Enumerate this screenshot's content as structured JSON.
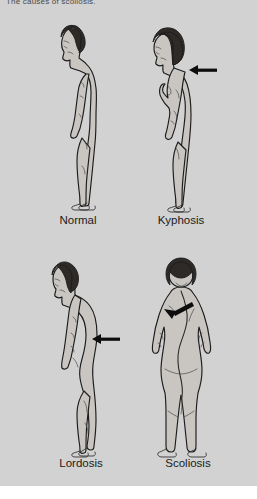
{
  "page": {
    "background_color": "#ffffff",
    "plate_color": "#d2d2d2",
    "partial_caption": "The causes of scoliosis."
  },
  "figures": [
    {
      "id": "normal",
      "label": "Normal",
      "view": "lateral (side) profile, facing left",
      "subject": "adult male standing upright",
      "hair": "short dark hair",
      "marker": "none",
      "description": "Normal spinal alignment with natural cervical, thoracic and lumbar curves."
    },
    {
      "id": "kyphosis",
      "label": "Kyphosis",
      "view": "lateral (side) profile, facing left",
      "subject": "adult female standing",
      "hair": "chin-length dark bob",
      "marker": "horizontal black arrow pointing left at the rounded upper (thoracic) back",
      "description": "Exaggerated outward curvature of the thoracic spine producing a rounded upper back."
    },
    {
      "id": "lordosis",
      "label": "Lordosis",
      "view": "lateral (side) profile, facing left",
      "subject": "adult male standing",
      "hair": "short dark hair",
      "marker": "horizontal black arrow pointing left at the inward-curved lower (lumbar) back",
      "description": "Exaggerated inward curvature of the lumbar spine, swaying the lower back forward."
    },
    {
      "id": "scoliosis",
      "label": "Scoliosis",
      "view": "posterior (rear) view",
      "subject": "adult female standing, back to viewer",
      "hair": "short dark hair",
      "marker": "diagonal black arrow pointing down-left at the laterally curved spine / raised shoulder blade",
      "description": "Sideways S-shaped lateral curvature of the spine with asymmetric shoulders and hips."
    }
  ],
  "colors": {
    "skin_fill": "#c9c6c2",
    "outline": "#1c1c1c",
    "hair": "#2e2a28",
    "arrow": "#0d0d0d",
    "label_text": "#1a1a1a"
  }
}
